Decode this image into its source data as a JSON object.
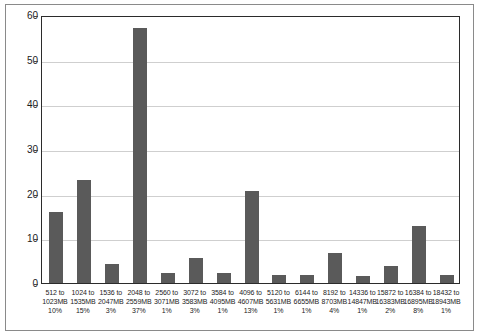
{
  "chart_data": {
    "type": "bar",
    "title": "",
    "xlabel": "",
    "ylabel": "",
    "ylim": [
      0,
      60
    ],
    "yticks": [
      0,
      10,
      20,
      30,
      40,
      50,
      60
    ],
    "grid": true,
    "legend": false,
    "bar_color": "#5a5a5a",
    "gridline_color": "#cfcfcf",
    "axis_color": "#2b2b2b",
    "categories": [
      "512 to 1023MB",
      "1024 to 1535MB",
      "1536 to 2047MB",
      "2048 to 2559MB",
      "2560 to 3071MB",
      "3072 to 3583MB",
      "3584 to 4095MB",
      "4096 to 4607MB",
      "5120 to 5631MB",
      "6144 to 6655MB",
      "8192 to 8703MB",
      "14336 to 14847MB",
      "15872 to 16383MB",
      "16384 to 16895MB",
      "18432 to 18943MB"
    ],
    "values": [
      16,
      23,
      4.3,
      57,
      2.3,
      5.5,
      2.3,
      20.5,
      1.7,
      1.7,
      6.8,
      1.5,
      3.7,
      12.8,
      1.7
    ],
    "percent_labels": [
      "10%",
      "15%",
      "3%",
      "37%",
      "1%",
      "3%",
      "1%",
      "13%",
      "1%",
      "1%",
      "4%",
      "1%",
      "2%",
      "8%",
      "1%"
    ],
    "tick_lines": [
      {
        "line1": "512 to",
        "line2": "1023MB",
        "line3": "10%"
      },
      {
        "line1": "1024 to",
        "line2": "1535MB",
        "line3": "15%"
      },
      {
        "line1": "1536 to",
        "line2": "2047MB",
        "line3": "3%"
      },
      {
        "line1": "2048 to",
        "line2": "2559MB",
        "line3": "37%"
      },
      {
        "line1": "2560 to",
        "line2": "3071MB",
        "line3": "1%"
      },
      {
        "line1": "3072 to",
        "line2": "3583MB",
        "line3": "3%"
      },
      {
        "line1": "3584 to",
        "line2": "4095MB",
        "line3": "1%"
      },
      {
        "line1": "4096 to",
        "line2": "4607MB",
        "line3": "13%"
      },
      {
        "line1": "5120 to",
        "line2": "5631MB",
        "line3": "1%"
      },
      {
        "line1": "6144 to",
        "line2": "6655MB",
        "line3": "1%"
      },
      {
        "line1": "8192 to",
        "line2": "8703MB",
        "line3": "4%"
      },
      {
        "line1": "14336 to",
        "line2": "14847MB",
        "line3": "1%"
      },
      {
        "line1": "15872 to",
        "line2": "16383MB",
        "line3": "2%"
      },
      {
        "line1": "16384 to",
        "line2": "16895MB",
        "line3": "8%"
      },
      {
        "line1": "18432 to",
        "line2": "18943MB",
        "line3": "1%"
      }
    ]
  }
}
